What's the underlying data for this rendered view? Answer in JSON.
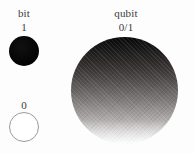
{
  "figure": {
    "background_color": "#fdfdfd",
    "width": 194,
    "height": 153
  },
  "bit_column": {
    "title": "bit",
    "states": [
      {
        "label": "1",
        "shape": "filled-circle",
        "fill_color": "#000000",
        "stroke_color": "#000000"
      },
      {
        "label": "0",
        "shape": "outlined-circle",
        "fill_color": "#ffffff",
        "stroke_color": "#9a9a9a"
      }
    ]
  },
  "qubit_column": {
    "title": "qubit",
    "state_label": "0/1",
    "shape": "gradient-sphere",
    "gradient_top_color": "#070707",
    "gradient_bottom_color": "#fbfbfb",
    "gradient_direction": "top-to-bottom"
  }
}
